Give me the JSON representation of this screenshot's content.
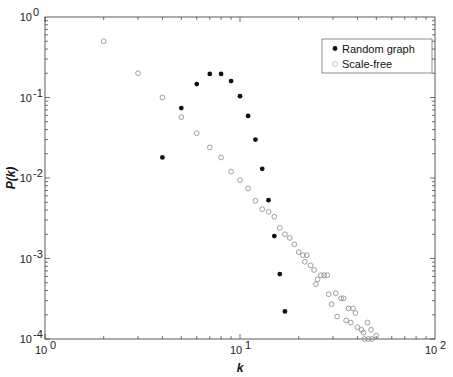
{
  "chart_data": {
    "type": "scatter",
    "title": "",
    "xlabel": "k",
    "ylabel": "P(k)",
    "xscale": "log",
    "yscale": "log",
    "xlim": [
      1,
      100
    ],
    "ylim": [
      0.0001,
      1
    ],
    "grid": false,
    "legend_position": "upper right",
    "x_ticks": [
      {
        "base": "10",
        "exp": "0"
      },
      {
        "base": "10",
        "exp": "1"
      },
      {
        "base": "10",
        "exp": "2"
      }
    ],
    "y_ticks": [
      {
        "base": "10",
        "exp": "0"
      },
      {
        "base": "10",
        "exp": "-1"
      },
      {
        "base": "10",
        "exp": "-2"
      },
      {
        "base": "10",
        "exp": "-3"
      },
      {
        "base": "10",
        "exp": "-4"
      }
    ],
    "series": [
      {
        "name": "Random graph",
        "marker": "filled-circle",
        "color": "#111111",
        "points": [
          [
            4,
            0.018
          ],
          [
            5,
            0.074
          ],
          [
            6,
            0.147
          ],
          [
            7,
            0.196
          ],
          [
            8,
            0.196
          ],
          [
            9,
            0.16
          ],
          [
            10,
            0.104
          ],
          [
            11,
            0.059
          ],
          [
            12,
            0.03
          ],
          [
            13,
            0.013
          ],
          [
            14,
            0.0053
          ],
          [
            15,
            0.0019
          ],
          [
            16,
            0.00064
          ],
          [
            17,
            0.00022
          ]
        ]
      },
      {
        "name": "Scale-free",
        "marker": "open-circle",
        "color": "#888888",
        "points": [
          [
            2,
            0.5
          ],
          [
            3,
            0.2
          ],
          [
            4,
            0.1
          ],
          [
            5,
            0.057
          ],
          [
            6,
            0.036
          ],
          [
            7,
            0.024
          ],
          [
            8,
            0.018
          ],
          [
            9,
            0.012
          ],
          [
            10,
            0.0094
          ],
          [
            11,
            0.0074
          ],
          [
            12,
            0.0052
          ],
          [
            13,
            0.0041
          ],
          [
            14,
            0.0038
          ],
          [
            15,
            0.0033
          ],
          [
            16,
            0.0024
          ],
          [
            17,
            0.002
          ],
          [
            18,
            0.0018
          ],
          [
            19,
            0.0015
          ],
          [
            20,
            0.0012
          ],
          [
            21,
            0.0011
          ],
          [
            22,
            0.0011
          ],
          [
            21.5,
            0.00091
          ],
          [
            23,
            0.00082
          ],
          [
            24,
            0.00072
          ],
          [
            26,
            0.00062
          ],
          [
            27,
            0.00062
          ],
          [
            28,
            0.00062
          ],
          [
            25,
            0.00055
          ],
          [
            24.5,
            0.00048
          ],
          [
            28.5,
            0.00036
          ],
          [
            31,
            0.00037
          ],
          [
            33,
            0.00032
          ],
          [
            34,
            0.00032
          ],
          [
            29.5,
            0.00027
          ],
          [
            36,
            0.00024
          ],
          [
            38,
            0.00024
          ],
          [
            39,
            0.00021
          ],
          [
            31.5,
            0.00019
          ],
          [
            35,
            0.00017
          ],
          [
            37,
            0.00016
          ],
          [
            45,
            0.00016
          ],
          [
            40,
            0.00014
          ],
          [
            42,
            0.00013
          ],
          [
            43,
            0.00012
          ],
          [
            47,
            0.00013
          ],
          [
            50,
            0.00011
          ],
          [
            43.5,
            0.0001
          ],
          [
            45.5,
            0.0001
          ],
          [
            47.5,
            0.0001
          ]
        ]
      }
    ]
  },
  "legend": {
    "items": [
      {
        "label": "Random graph"
      },
      {
        "label": "Scale-free"
      }
    ]
  },
  "axes": {
    "xlabel": "k",
    "ylabel": "P(k)"
  }
}
